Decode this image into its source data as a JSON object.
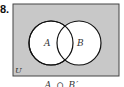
{
  "problem_number": "8.",
  "diagram": {
    "universe_label": "U",
    "sets": [
      {
        "label": "A",
        "cx": 51,
        "cy": 43,
        "r": 22
      },
      {
        "label": "B",
        "cx": 79,
        "cy": 43,
        "r": 22
      }
    ],
    "shaded_color": "#c8c8c8",
    "unshaded_color": "#ffffff"
  },
  "caption": "A ∩ B′"
}
